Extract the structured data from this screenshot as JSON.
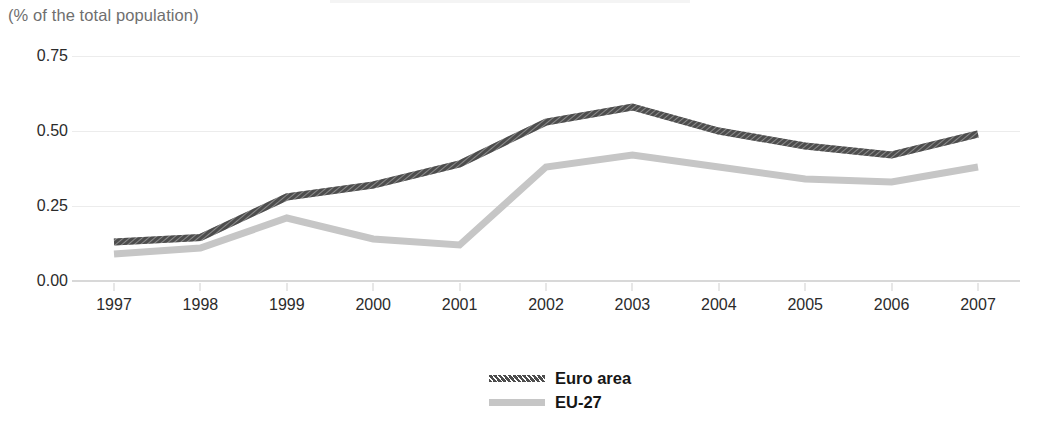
{
  "subtitle": "(% of the total population)",
  "colors": {
    "euro_area": "#4d4d4d",
    "eu27": "#c6c6c6",
    "gridline": "#ececec",
    "axis": "#d8d8d8",
    "tick_text": "#2b2b2b",
    "subtitle_text": "#6f6f6f"
  },
  "legend": {
    "position": "bottom-center",
    "items": [
      {
        "label": "Euro area",
        "swatch": "dark-hatched-line",
        "color": "#4d4d4d"
      },
      {
        "label": "EU-27",
        "swatch": "light-solid-line",
        "color": "#c6c6c6"
      }
    ]
  },
  "y_axis": {
    "ticks": [
      "0.00",
      "0.25",
      "0.50",
      "0.75"
    ],
    "values": [
      0.0,
      0.25,
      0.5,
      0.75
    ],
    "min": 0.0,
    "max": 0.75
  },
  "x_axis": {
    "ticks": [
      "1997",
      "1998",
      "1999",
      "2000",
      "2001",
      "2002",
      "2003",
      "2004",
      "2005",
      "2006",
      "2007"
    ]
  },
  "chart_data": {
    "type": "line",
    "title": "",
    "subtitle": "(% of the total population)",
    "xlabel": "",
    "ylabel": "",
    "ylim": [
      0.0,
      0.75
    ],
    "yticks": [
      0.0,
      0.25,
      0.5,
      0.75
    ],
    "grid": true,
    "legend_position": "bottom-center",
    "categories": [
      "1997",
      "1998",
      "1999",
      "2000",
      "2001",
      "2002",
      "2003",
      "2004",
      "2005",
      "2006",
      "2007"
    ],
    "series": [
      {
        "name": "Euro area",
        "color": "#4d4d4d",
        "style": "hatched",
        "values": [
          0.13,
          0.145,
          0.28,
          0.32,
          0.39,
          0.53,
          0.58,
          0.5,
          0.45,
          0.42,
          0.49
        ]
      },
      {
        "name": "EU-27",
        "color": "#c6c6c6",
        "style": "solid",
        "values": [
          0.09,
          0.11,
          0.21,
          0.14,
          0.12,
          0.38,
          0.42,
          0.38,
          0.34,
          0.33,
          0.38
        ]
      }
    ]
  }
}
